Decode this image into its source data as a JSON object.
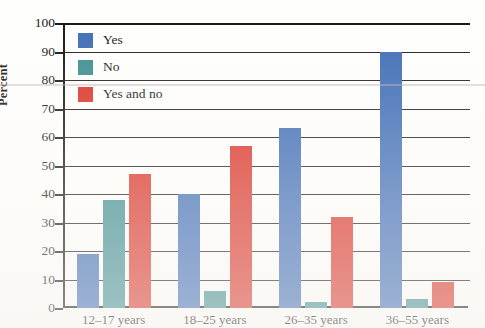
{
  "chart_data": {
    "type": "bar",
    "title": "",
    "xlabel": "",
    "ylabel": "Percent",
    "ylim": [
      0,
      100
    ],
    "ytick_step": 10,
    "yticks": [
      0,
      10,
      20,
      30,
      40,
      50,
      60,
      70,
      80,
      90,
      100
    ],
    "grid": true,
    "legend_position": "top-left inside plot",
    "categories": [
      "12–17 years",
      "18–25 years",
      "26–35 years",
      "36–55 years"
    ],
    "series": [
      {
        "name": "Yes",
        "color": "#3b6ab5",
        "values": [
          19,
          40,
          63,
          90
        ]
      },
      {
        "name": "No",
        "color": "#3a8b8f",
        "values": [
          38,
          6,
          2,
          3
        ]
      },
      {
        "name": "Yes and no",
        "color": "#d93025",
        "values": [
          47,
          57,
          32,
          9
        ]
      }
    ]
  }
}
